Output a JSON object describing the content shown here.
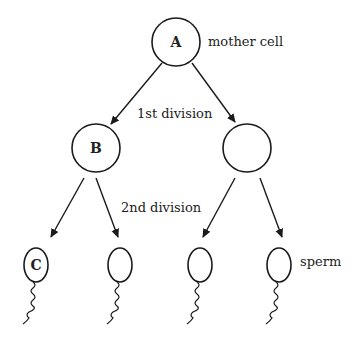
{
  "diagram": {
    "title": "",
    "cells": {
      "mother": {
        "letter": "A",
        "label": "mother cell"
      },
      "first_left": {
        "letter": "B"
      },
      "first_right": {
        "letter": ""
      },
      "sperm1": {
        "letter": "C"
      },
      "sperm2": {
        "letter": ""
      },
      "sperm3": {
        "letter": ""
      },
      "sperm4": {
        "letter": "",
        "label": "sperm"
      }
    },
    "stages": {
      "first": "1st division",
      "second": "2nd division"
    },
    "colors": {
      "stroke": "#1a1a1a",
      "background": "#ffffff"
    }
  }
}
